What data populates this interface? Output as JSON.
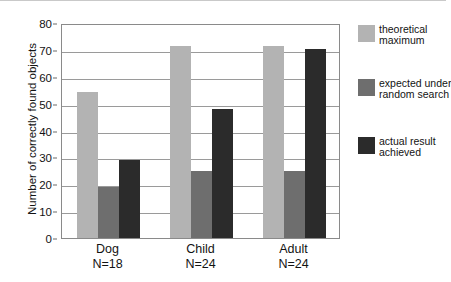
{
  "chart_data": {
    "type": "bar",
    "title": "",
    "xlabel": "",
    "ylabel": "Number of correctly found objects",
    "ylim": [
      0,
      80
    ],
    "ytick_step": 10,
    "yticks": [
      0,
      10,
      20,
      30,
      40,
      50,
      60,
      70,
      80
    ],
    "grid": true,
    "legend_position": "right",
    "categories": [
      "Dog",
      "Child",
      "Adult"
    ],
    "category_sublabels": [
      "N=18",
      "N=24",
      "N=24"
    ],
    "series": [
      {
        "name": "theoretical maximum",
        "legend_line1": "theoretical",
        "legend_line2": "maximum",
        "color": "#b3b3b3",
        "values": [
          54.5,
          71.5,
          71.5
        ]
      },
      {
        "name": "expected under random search",
        "legend_line1": "expected under",
        "legend_line2": "random search",
        "color": "#6e6e6e",
        "values": [
          19,
          25,
          25
        ]
      },
      {
        "name": "actual result achieved",
        "legend_line1": "actual result",
        "legend_line2": "achieved",
        "color": "#2b2b2b",
        "values": [
          29,
          48,
          70.5
        ]
      }
    ]
  },
  "axis": {
    "y_title": "Number of correctly found objects",
    "y_tick_labels": [
      "80",
      "70",
      "60",
      "50",
      "40",
      "30",
      "20",
      "10",
      "0"
    ]
  },
  "x_axis": {
    "groups": [
      {
        "name": "Dog",
        "n": "N=18"
      },
      {
        "name": "Child",
        "n": "N=24"
      },
      {
        "name": "Adult",
        "n": "N=24"
      }
    ]
  },
  "legend": {
    "entries": [
      {
        "line1": "theoretical",
        "line2": "maximum",
        "color": "#b3b3b3"
      },
      {
        "line1": "expected under",
        "line2": "random search",
        "color": "#6e6e6e"
      },
      {
        "line1": "actual result",
        "line2": "achieved",
        "color": "#2b2b2b"
      }
    ]
  },
  "colors": {
    "theoretical_maximum": "#b3b3b3",
    "expected_random": "#6e6e6e",
    "actual_result": "#2b2b2b",
    "axis": "#8a8a8a",
    "gridline": "#9a9a9a",
    "text": "#131313"
  }
}
